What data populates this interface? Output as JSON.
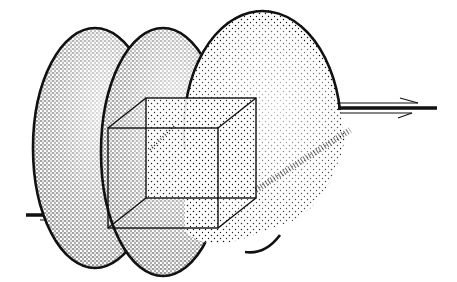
{
  "figure": {
    "background": "#ffffff",
    "ink": "#111111",
    "ellipsoids": [
      {
        "name": "left",
        "cx": 95,
        "cy": 148,
        "rx": 62,
        "ry": 120
      },
      {
        "name": "middle",
        "cx": 163,
        "cy": 156,
        "rx": 62,
        "ry": 120
      },
      {
        "name": "right",
        "cx": 263,
        "cy": 142,
        "rx": 80,
        "ry": 118
      }
    ],
    "cube": {
      "front": {
        "x": 108,
        "y": 128,
        "w": 110,
        "h": 100
      },
      "back": {
        "x": 146,
        "y": 98,
        "w": 110,
        "h": 100
      }
    },
    "axis": {
      "y": 108,
      "x_start": 22,
      "x_end": 437,
      "arrow_head": "double-sided open arrow"
    }
  }
}
